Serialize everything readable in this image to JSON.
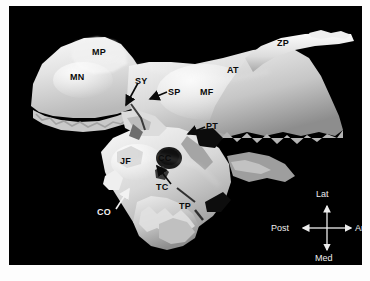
{
  "figure": {
    "background_color": "#ffffff",
    "plate_background": "#000000",
    "label_color_dark": "#0a0a0a",
    "label_color_light": "#f2f2f2"
  },
  "labels": [
    {
      "id": "MP",
      "text": "MP",
      "x": 92,
      "y": 48,
      "tone": "dark",
      "arrow": false
    },
    {
      "id": "MN",
      "text": "MN",
      "x": 70,
      "y": 73,
      "tone": "dark",
      "arrow": false
    },
    {
      "id": "SY",
      "text": "SY",
      "x": 135,
      "y": 77,
      "tone": "dark",
      "arrow": true
    },
    {
      "id": "SP",
      "text": "SP",
      "x": 168,
      "y": 88,
      "tone": "dark",
      "arrow": true
    },
    {
      "id": "AT",
      "text": "AT",
      "x": 227,
      "y": 66,
      "tone": "dark",
      "arrow": false
    },
    {
      "id": "ZP",
      "text": "ZP",
      "x": 277,
      "y": 39,
      "tone": "dark",
      "arrow": false
    },
    {
      "id": "MF",
      "text": "MF",
      "x": 200,
      "y": 88,
      "tone": "dark",
      "arrow": false
    },
    {
      "id": "PT",
      "text": "PT",
      "x": 203,
      "y": 122,
      "tone": "dark",
      "arrow": true
    },
    {
      "id": "JF",
      "text": "JF",
      "x": 119,
      "y": 157,
      "tone": "dark",
      "arrow": false
    },
    {
      "id": "CC",
      "text": "CC",
      "x": 158,
      "y": 154,
      "tone": "dark",
      "arrow": false
    },
    {
      "id": "TC",
      "text": "TC",
      "x": 155,
      "y": 183,
      "tone": "dark",
      "arrow": true
    },
    {
      "id": "TP",
      "text": "TP",
      "x": 178,
      "y": 202,
      "tone": "dark",
      "arrow": false
    },
    {
      "id": "CO",
      "text": "CO",
      "x": 96,
      "y": 208,
      "tone": "light",
      "arrow": true
    }
  ],
  "compass": {
    "up": "Lat",
    "right": "Ant",
    "down": "Med",
    "left": "Post",
    "color": "#ededed"
  }
}
